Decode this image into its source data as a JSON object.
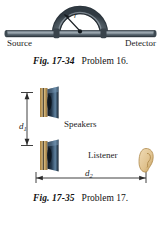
{
  "document": {
    "type": "textbook-figure-panel",
    "page_background": "#ffffff"
  },
  "figures": [
    {
      "id": "fig-17-34",
      "number": "Fig. 17-34",
      "problem": "Problem 16.",
      "art": {
        "kind": "acoustic-interferometer-tube",
        "labels": {
          "source": "Source",
          "detector": "Detector",
          "radius": "r"
        },
        "colors": {
          "tube_dark": "#3b4650",
          "tube_mid": "#5a6771",
          "tube_highlight": "#8d98a1",
          "tube_shadow": "#2a333b",
          "leader_line": "#20262b"
        },
        "geometry": {
          "tube_y": 33,
          "tube_left": 6,
          "tube_right": 155,
          "tube_thickness": 6,
          "arc_center_x": 80,
          "arc_radius": 24,
          "arc_thickness": 6
        }
      }
    },
    {
      "id": "fig-17-35",
      "number": "Fig. 17-35",
      "problem": "Problem 17.",
      "art": {
        "kind": "two-speakers-and-listener",
        "labels": {
          "speakers": "Speakers",
          "listener": "Listener",
          "d1": "d",
          "d1_sub": "1",
          "d2": "d",
          "d2_sub": "2"
        },
        "colors": {
          "baffle_light": "#e3c893",
          "baffle_mid": "#c8a464",
          "baffle_dark": "#9c7a3e",
          "cone_dark": "#16202c",
          "cone_mid": "#25384c",
          "cone_light": "#5d7f9c",
          "ear_fill": "#e8cfa5",
          "ear_line": "#b8904f",
          "dimension_line": "#2a2a2a"
        },
        "geometry": {
          "speaker_top_y": 14,
          "speaker_bottom_y": 70,
          "speaker_x": 46,
          "dim_v_x": 27,
          "dim_h_y": 92,
          "dim_h_left": 36,
          "dim_h_right": 146,
          "listener_x": 146,
          "listener_y": 70
        }
      }
    }
  ]
}
